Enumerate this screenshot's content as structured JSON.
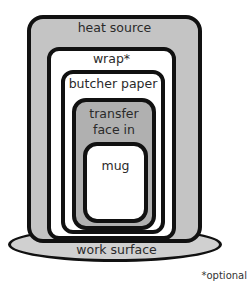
{
  "diagram": {
    "layers": [
      {
        "id": "heat-source",
        "label": "heat source",
        "fill": "#c4c4c4"
      },
      {
        "id": "wrap",
        "label": "wrap*",
        "fill": "#ffffff"
      },
      {
        "id": "butcher-paper",
        "label": "butcher paper",
        "fill": "#ffffff"
      },
      {
        "id": "transfer",
        "label": "transfer\nface in",
        "line1": "transfer",
        "line2": "face in",
        "fill": "#b0b0b0"
      },
      {
        "id": "mug",
        "label": "mug",
        "fill": "#ffffff"
      }
    ],
    "base": {
      "label": "work surface",
      "fill": "#d0d0d0"
    },
    "footnote": "*optional"
  }
}
